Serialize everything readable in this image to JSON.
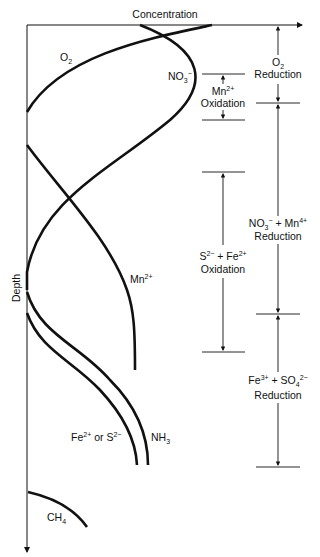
{
  "diagram": {
    "x_axis_label": "Concentration",
    "y_axis_label": "Depth",
    "curves": {
      "o2": {
        "label": "O",
        "sub": "2"
      },
      "no3": {
        "label": "NO",
        "sub": "3",
        "sup": "−"
      },
      "mn2": {
        "label": "Mn",
        "sup": "2+"
      },
      "fe_s": {
        "label_a": "Fe",
        "sup_a": "2+",
        "mid": " or S",
        "sup_b": "2−"
      },
      "nh3": {
        "label": "NH",
        "sub": "3"
      },
      "ch4": {
        "label": "CH",
        "sub": "4"
      }
    },
    "zones_left": [
      {
        "line1": "Mn",
        "line1_sup": "2+",
        "line2": "Oxidation"
      },
      {
        "line1a": "S",
        "line1a_sup": "2−",
        "line1b": " + Fe",
        "line1b_sup": "2+",
        "line2": "Oxidation"
      }
    ],
    "zones_right": [
      {
        "line1": "O",
        "line1_sub": "2",
        "line2": "Reduction"
      },
      {
        "line1a": "NO",
        "line1a_sub": "3",
        "line1a_sup": "−",
        "line1b": " + Mn",
        "line1b_sup": "4+",
        "line2": "Reduction"
      },
      {
        "line1a": "Fe",
        "line1a_sup": "3+",
        "line1b": " + SO",
        "line1b_sub": "4",
        "line1b_sup": "2−",
        "line2": "Reduction"
      }
    ]
  }
}
